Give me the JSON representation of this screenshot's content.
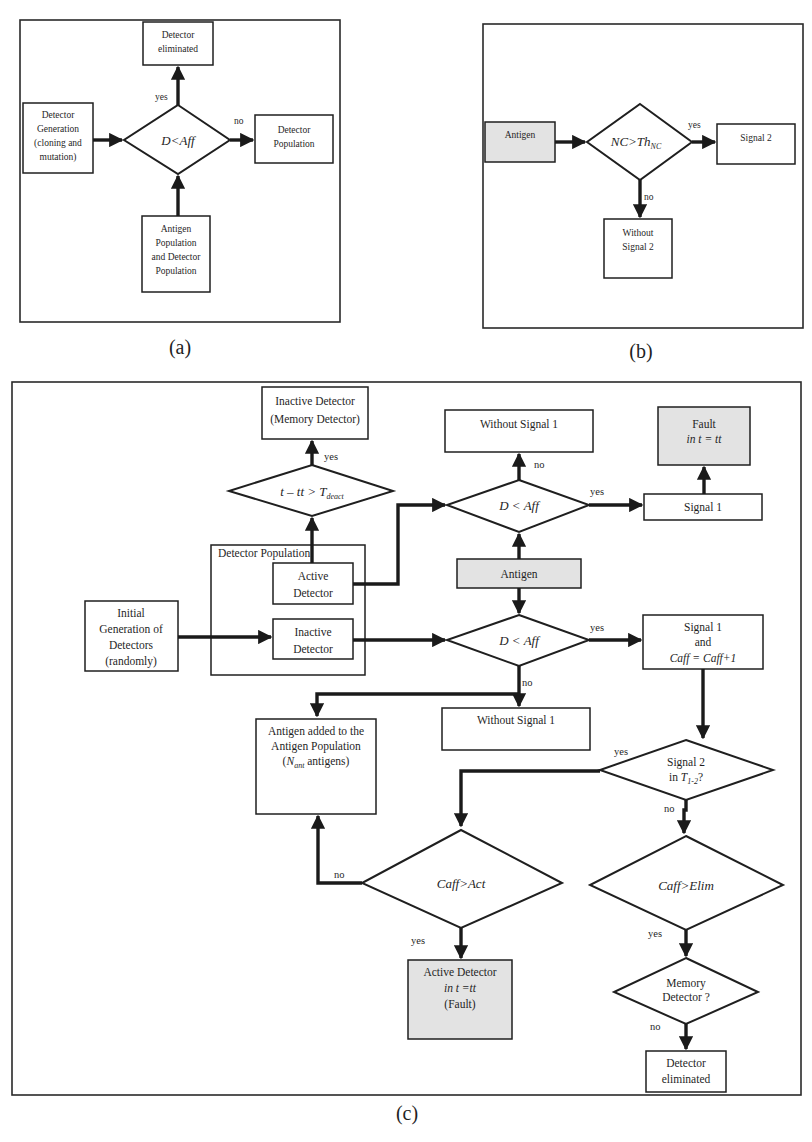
{
  "panel_a": {
    "caption": "(a)",
    "boxes": {
      "eliminated": [
        "Detector",
        "eliminated"
      ],
      "generation": [
        "Detector",
        "Generation",
        "(cloning and",
        "mutation)"
      ],
      "population": [
        "Detector",
        "Population"
      ],
      "antigen": [
        "Antigen",
        "Population",
        "and Detector",
        "Population"
      ]
    },
    "decision": "D<Aff",
    "labels": {
      "yes": "yes",
      "no": "no"
    }
  },
  "panel_b": {
    "caption": "(b)",
    "boxes": {
      "antigen": [
        "Antigen"
      ],
      "signal2": [
        "Signal 2"
      ],
      "without": [
        "Without",
        "Signal 2"
      ]
    },
    "decision": "NC>Th",
    "decision_sub": "NC",
    "labels": {
      "yes": "yes",
      "no": "no"
    }
  },
  "panel_c": {
    "caption": "(c)",
    "group_label": "Detector Population",
    "boxes": {
      "inactive_memory": [
        "Inactive Detector",
        "(Memory Detector)"
      ],
      "without_signal1_top": [
        "Without Signal 1"
      ],
      "fault": [
        "Fault",
        "in t = tt"
      ],
      "signal1": [
        "Signal 1"
      ],
      "antigen": [
        "Antigen"
      ],
      "active_detector": [
        "Active",
        "Detector"
      ],
      "inactive_detector": [
        "Inactive",
        "Detector"
      ],
      "initial_generation": [
        "Initial",
        "Generation of",
        "Detectors",
        "(randomly)"
      ],
      "signal1_caff": [
        "Signal 1",
        "and",
        "Caff = Caff+1"
      ],
      "without_signal1_bottom": [
        "Without Signal 1"
      ],
      "antigen_added": [
        "Antigen added to the",
        "Antigen Population",
        "(N ant antigens)"
      ],
      "active_detector_fault": [
        "Active Detector",
        "in t =tt",
        "(Fault)"
      ],
      "detector_eliminated": [
        "Detector",
        "eliminated"
      ]
    },
    "decisions": {
      "deact": "t – tt > T",
      "deact_sub": "deact",
      "d_aff_top": "D < Aff",
      "d_aff_bottom": "D < Aff",
      "signal2": [
        "Signal 2",
        "in T"
      ],
      "signal2_sub": "1-2",
      "signal2_tail": "?",
      "caff_act": "Caff>Act",
      "caff_elim": "Caff>Elim",
      "memory": [
        "Memory",
        "Detector ?"
      ]
    },
    "labels": {
      "yes": "yes",
      "no": "no"
    }
  }
}
